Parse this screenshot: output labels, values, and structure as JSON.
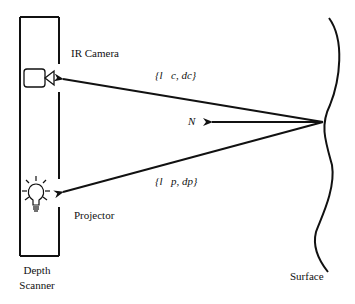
{
  "diagram": {
    "labels": {
      "ir_camera": "IR Camera",
      "projector": "Projector",
      "depth_scanner_line1": "Depth",
      "depth_scanner_line2": "Scanner",
      "surface": "Surface"
    },
    "math_labels": {
      "camera_ray": "{l⃗c, dc}",
      "normal": "N⃗",
      "projector_ray": "{l⃗p, dp}"
    },
    "icons": {
      "camera": "video-camera-icon",
      "projector": "light-bulb-icon"
    },
    "colors": {
      "stroke": "#111111",
      "background": "#ffffff"
    }
  }
}
